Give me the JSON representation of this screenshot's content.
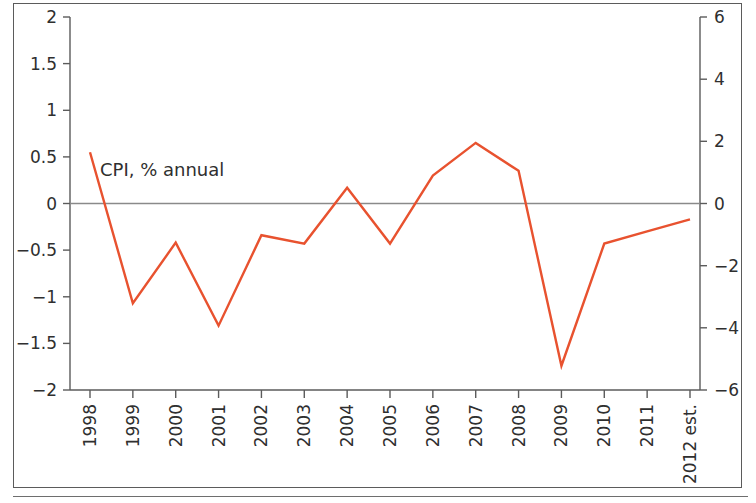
{
  "chart_data": {
    "type": "line",
    "title": "",
    "subtitle": "",
    "xlabel": "",
    "ylabel": "",
    "categories": [
      "1998",
      "1999",
      "2000",
      "2001",
      "2002",
      "2003",
      "2004",
      "2005",
      "2006",
      "2007",
      "2008",
      "2009",
      "2010",
      "2011",
      "2012 est."
    ],
    "series": [
      {
        "name": "CPI, % annual",
        "color": "#E8522F",
        "axis": "left",
        "values": [
          0.55,
          -1.07,
          -0.42,
          -1.31,
          -0.34,
          -0.43,
          0.17,
          -0.43,
          0.3,
          0.65,
          0.35,
          -1.74,
          -0.43,
          -0.3,
          -0.17
        ]
      }
    ],
    "annotations": [
      {
        "text": "CPI, % annual",
        "x": "1998",
        "y": 0.36
      }
    ],
    "left_axis": {
      "ticks": [
        "2",
        "1.5",
        "1",
        "0.5",
        "0",
        "−0.5",
        "−1",
        "−1.5",
        "−2"
      ],
      "values": [
        2,
        1.5,
        1,
        0.5,
        0,
        -0.5,
        -1,
        -1.5,
        -2
      ],
      "ylim": [
        -2,
        2
      ]
    },
    "right_axis": {
      "ticks": [
        "6",
        "4",
        "2",
        "0",
        "−2",
        "−4",
        "−6"
      ],
      "values": [
        6,
        4,
        2,
        0,
        -2,
        -4,
        -6
      ],
      "ylim": [
        -6,
        6
      ]
    },
    "grid": false,
    "legend": "none",
    "zero_line": true,
    "zero_line_color": "#8a8a8a"
  },
  "figure": {
    "background_color": "#ffffff",
    "frame_color": "#5b5b5b"
  }
}
